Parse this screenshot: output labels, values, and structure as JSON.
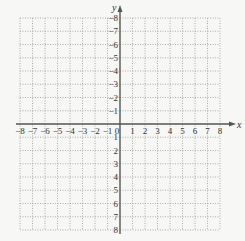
{
  "chart_data": {
    "type": "coordinate-grid",
    "title": "",
    "xlabel": "x",
    "ylabel": "y",
    "xlim": [
      -8,
      8
    ],
    "ylim": [
      -8,
      8
    ],
    "grid": "dotted",
    "grid_step": 1,
    "x_ticks": [
      -8,
      -7,
      -6,
      -5,
      -4,
      -3,
      -2,
      -1,
      0,
      1,
      2,
      3,
      4,
      5,
      6,
      7,
      8
    ],
    "y_ticks": [
      -8,
      -7,
      -6,
      -5,
      -4,
      -3,
      -2,
      -1,
      1,
      2,
      3,
      4,
      5,
      6,
      7,
      8
    ],
    "x_tick_labels": [
      "−8",
      "−7",
      "−6",
      "−5",
      "−4",
      "−3",
      "−2",
      "−1",
      "0",
      "1",
      "2",
      "3",
      "4",
      "5",
      "6",
      "7",
      "8"
    ],
    "y_tick_labels": [
      "8",
      "7",
      "6",
      "5",
      "4",
      "3",
      "2",
      "1",
      "−1",
      "−2",
      "−3",
      "−4",
      "−5",
      "−6",
      "−7",
      "−8"
    ],
    "points": []
  },
  "colors": {
    "background": "#f7f7f5",
    "axis": "#555555",
    "grid": "#9a9a9a",
    "text": "#333333"
  },
  "layout": {
    "origin_x": 120,
    "origin_y": 124,
    "unit_x": 12.5,
    "unit_y": 13.25
  }
}
